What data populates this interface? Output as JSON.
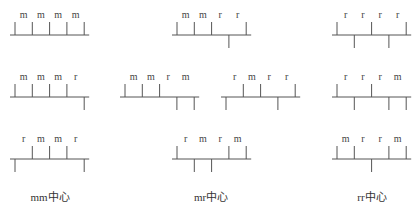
{
  "diagram": {
    "tick_length": 13,
    "line_color": "#555555",
    "groups": [
      {
        "name": "mm-centered",
        "caption": "mm中心",
        "caption_x": 50,
        "items": [
          {
            "x": 15,
            "y": 35,
            "labels": [
              "m",
              "m",
              "m",
              "m"
            ],
            "ticks": [
              "up",
              "up",
              "up",
              "up",
              "up"
            ]
          },
          {
            "x": 15,
            "y": 97,
            "labels": [
              "m",
              "m",
              "m",
              "r"
            ],
            "ticks": [
              "up",
              "up",
              "up",
              "up",
              "down"
            ]
          },
          {
            "x": 15,
            "y": 159,
            "labels": [
              "r",
              "m",
              "m",
              "r"
            ],
            "ticks": [
              "down",
              "up",
              "up",
              "up",
              "down"
            ]
          }
        ]
      },
      {
        "name": "mr-centered",
        "caption": "mr中心",
        "caption_x": 211,
        "items": [
          {
            "x": 177,
            "y": 35,
            "labels": [
              "m",
              "m",
              "r",
              "r"
            ],
            "ticks": [
              "up",
              "up",
              "up",
              "down",
              "up"
            ]
          },
          {
            "x": 125,
            "y": 97,
            "labels": [
              "m",
              "m",
              "r",
              "m"
            ],
            "ticks": [
              "up",
              "up",
              "up",
              "down",
              "down"
            ]
          },
          {
            "x": 226,
            "y": 97,
            "labels": [
              "r",
              "m",
              "r",
              "r"
            ],
            "ticks": [
              "down",
              "up",
              "up",
              "down",
              "up"
            ]
          },
          {
            "x": 177,
            "y": 159,
            "labels": [
              "r",
              "m",
              "r",
              "m"
            ],
            "ticks": [
              "up",
              "down",
              "down",
              "up",
              "up"
            ]
          }
        ]
      },
      {
        "name": "rr-centered",
        "caption": "rr中心",
        "caption_x": 372,
        "items": [
          {
            "x": 337,
            "y": 35,
            "labels": [
              "r",
              "r",
              "r",
              "r"
            ],
            "ticks": [
              "up",
              "down",
              "up",
              "down",
              "up"
            ]
          },
          {
            "x": 337,
            "y": 97,
            "labels": [
              "r",
              "r",
              "r",
              "m"
            ],
            "ticks": [
              "up",
              "down",
              "up",
              "down",
              "down"
            ]
          },
          {
            "x": 337,
            "y": 159,
            "labels": [
              "m",
              "r",
              "r",
              "m"
            ],
            "ticks": [
              "up",
              "up",
              "down",
              "up",
              "up"
            ]
          }
        ]
      }
    ]
  }
}
